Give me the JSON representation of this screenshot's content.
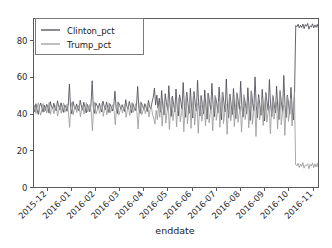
{
  "chart_data": {
    "type": "line",
    "title": "",
    "xlabel": "enddate",
    "ylabel": "",
    "ylim": [
      0,
      92
    ],
    "yticks": [
      0,
      20,
      40,
      60,
      80
    ],
    "ytick_labels": [
      "0",
      "20",
      "40",
      "60",
      "80"
    ],
    "xtick_labels": [
      "2015-12",
      "2016-01",
      "2016-02",
      "2016-03",
      "2016-04",
      "2016-05",
      "2016-06",
      "2016-07",
      "2016-08",
      "2016-09",
      "2016-10",
      "2016-11"
    ],
    "xtick_rotation": -45,
    "grid": false,
    "legend_position": "upper left",
    "legend_labels": [
      "Clinton_pct",
      "Trump_pct"
    ],
    "colors": {
      "clinton": "#4c4c55",
      "trump": "#9b9b9b"
    },
    "series": [
      {
        "name": "Clinton_pct",
        "color": "#4c4c55",
        "values": [
          43.0,
          41.2,
          45.6,
          42.3,
          39.8,
          44.1,
          46.0,
          43.5,
          41.0,
          44.8,
          42.0,
          45.3,
          43.9,
          40.5,
          46.7,
          44.2,
          42.8,
          45.9,
          43.1,
          41.7,
          47.2,
          44.5,
          42.2,
          46.1,
          43.4,
          40.9,
          45.0,
          43.8,
          41.5,
          44.7,
          56.3,
          43.2,
          40.1,
          46.8,
          44.0,
          42.6,
          45.5,
          43.0,
          41.8,
          47.5,
          44.3,
          42.1,
          46.4,
          43.7,
          40.6,
          45.2,
          43.5,
          41.2,
          44.9,
          58.1,
          43.3,
          40.4,
          46.0,
          44.6,
          42.9,
          45.8,
          43.2,
          41.1,
          47.0,
          44.4,
          42.3,
          46.6,
          43.6,
          40.8,
          45.4,
          43.9,
          41.6,
          44.2,
          52.4,
          43.1,
          40.2,
          46.3,
          44.7,
          42.5,
          45.1,
          43.3,
          41.4,
          47.8,
          44.1,
          42.7,
          46.9,
          43.8,
          40.7,
          45.7,
          43.4,
          41.9,
          44.5,
          55.0,
          43.0,
          40.3,
          46.2,
          44.8,
          42.4,
          45.6,
          43.7,
          41.3,
          47.4,
          44.0,
          42.8,
          46.5,
          49.2,
          54.1,
          45.0,
          50.3,
          43.2,
          48.6,
          41.0,
          52.8,
          44.3,
          39.5,
          51.0,
          46.2,
          42.0,
          55.4,
          44.9,
          38.7,
          49.8,
          45.3,
          41.2,
          53.6,
          43.8,
          39.0,
          50.5,
          46.8,
          42.6,
          57.2,
          44.1,
          38.2,
          51.9,
          45.7,
          40.4,
          54.0,
          43.5,
          37.8,
          52.3,
          46.0,
          41.6,
          58.4,
          44.6,
          38.9,
          50.1,
          45.2,
          40.0,
          53.1,
          43.9,
          37.2,
          51.4,
          46.5,
          42.2,
          56.7,
          44.8,
          38.5,
          49.4,
          45.9,
          40.8,
          54.7,
          43.3,
          36.9,
          52.0,
          46.3,
          41.1,
          59.0,
          44.2,
          38.0,
          50.8,
          45.5,
          39.7,
          53.9,
          43.6,
          37.5,
          51.2,
          46.9,
          42.4,
          57.8,
          44.0,
          38.3,
          49.0,
          45.6,
          40.2,
          54.3,
          43.1,
          36.5,
          52.6,
          46.1,
          41.8,
          60.2,
          44.5,
          37.9,
          50.6,
          45.0,
          39.3,
          53.4,
          43.7,
          36.2,
          51.7,
          46.6,
          42.0,
          58.8,
          44.9,
          38.6,
          49.6,
          45.4,
          40.6,
          55.1,
          43.4,
          37.0,
          52.2,
          46.4,
          41.4,
          61.0,
          44.7,
          38.1,
          50.3,
          45.8,
          39.9,
          54.5,
          43.2,
          36.7,
          51.5,
          88.2,
          87.5,
          88.9,
          86.8,
          88.4,
          87.1,
          89.0,
          86.5,
          88.7,
          87.8,
          89.3,
          86.2,
          88.0,
          87.4,
          89.1,
          86.9,
          88.5,
          87.2,
          88.8,
          86.6
        ]
      },
      {
        "name": "Trump_pct",
        "color": "#9b9b9b",
        "values": [
          41.5,
          44.8,
          40.2,
          43.6,
          46.1,
          41.9,
          39.4,
          43.0,
          45.7,
          41.2,
          44.3,
          40.6,
          42.8,
          46.4,
          39.8,
          42.5,
          44.0,
          40.1,
          43.3,
          45.2,
          38.9,
          42.1,
          44.9,
          40.4,
          43.8,
          46.0,
          41.0,
          42.9,
          45.5,
          41.3,
          32.7,
          43.2,
          46.3,
          39.6,
          42.6,
          44.5,
          40.8,
          43.4,
          45.0,
          38.5,
          42.3,
          44.7,
          40.0,
          43.1,
          46.2,
          41.1,
          42.8,
          45.3,
          41.4,
          30.9,
          43.0,
          46.5,
          39.9,
          42.0,
          44.2,
          40.3,
          43.5,
          45.8,
          38.7,
          42.4,
          44.6,
          39.5,
          43.2,
          46.1,
          40.7,
          42.7,
          45.1,
          41.6,
          34.2,
          43.3,
          46.6,
          39.4,
          41.8,
          44.4,
          40.5,
          43.6,
          45.4,
          38.2,
          42.2,
          44.1,
          39.2,
          43.0,
          46.3,
          40.9,
          42.9,
          45.6,
          41.0,
          31.8,
          43.4,
          46.7,
          39.7,
          41.5,
          44.0,
          40.2,
          43.1,
          45.9,
          38.4,
          42.6,
          44.3,
          39.6,
          37.8,
          34.5,
          42.0,
          36.9,
          44.6,
          38.2,
          46.8,
          33.4,
          42.7,
          48.5,
          35.0,
          40.9,
          45.2,
          31.6,
          42.1,
          49.3,
          36.4,
          41.8,
          46.0,
          33.0,
          43.5,
          48.9,
          35.8,
          40.2,
          44.7,
          30.4,
          42.9,
          50.1,
          34.6,
          41.3,
          47.2,
          32.2,
          43.8,
          50.8,
          34.0,
          40.8,
          45.8,
          29.5,
          42.4,
          49.5,
          36.1,
          41.6,
          47.6,
          33.6,
          43.2,
          51.4,
          35.2,
          40.4,
          44.9,
          30.8,
          42.2,
          50.2,
          36.6,
          41.1,
          46.9,
          32.8,
          43.9,
          52.0,
          34.8,
          40.6,
          45.5,
          28.9,
          42.8,
          49.9,
          36.3,
          41.4,
          48.1,
          33.2,
          43.4,
          51.7,
          35.5,
          40.0,
          44.2,
          30.1,
          42.5,
          50.6,
          37.0,
          41.9,
          47.0,
          32.5,
          44.1,
          52.6,
          34.4,
          40.7,
          45.1,
          27.8,
          42.3,
          49.1,
          36.8,
          41.2,
          48.4,
          33.8,
          43.6,
          51.1,
          35.6,
          40.3,
          44.5,
          29.2,
          42.6,
          50.4,
          37.2,
          41.7,
          46.5,
          32.0,
          44.3,
          53.2,
          34.2,
          40.5,
          45.0,
          28.4,
          42.0,
          49.7,
          36.0,
          41.0,
          48.8,
          33.5,
          43.0,
          52.1,
          12.5,
          11.8,
          13.2,
          10.9,
          12.8,
          11.4,
          13.6,
          10.5,
          12.2,
          11.9,
          13.0,
          10.2,
          12.6,
          11.6,
          13.4,
          10.7,
          12.9,
          11.2,
          13.1,
          10.4
        ]
      }
    ]
  }
}
